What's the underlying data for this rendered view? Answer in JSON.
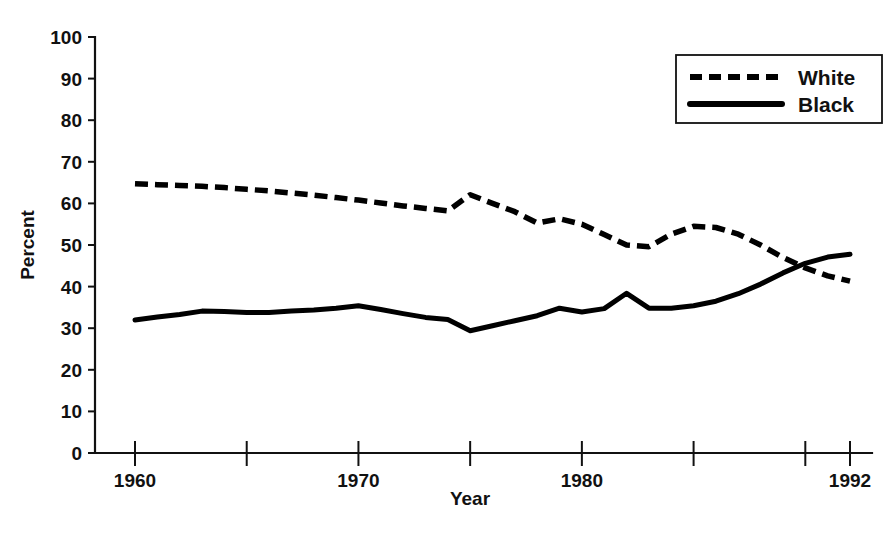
{
  "chart_data": {
    "type": "line",
    "title": "",
    "xlabel": "Year",
    "ylabel": "Percent",
    "xlim": [
      1960,
      1992
    ],
    "ylim": [
      0,
      100
    ],
    "grid": false,
    "legend_position": "top-right",
    "y_ticks": [
      0,
      10,
      20,
      30,
      40,
      50,
      60,
      70,
      80,
      90,
      100
    ],
    "y_tick_labels": [
      "0",
      "10",
      "20",
      "30",
      "40",
      "50",
      "60",
      "70",
      "80",
      "90",
      "100"
    ],
    "x_ticks": [
      1960,
      1965,
      1970,
      1975,
      1980,
      1985,
      1990,
      1992
    ],
    "x_tick_labels": [
      "1960",
      "",
      "1970",
      "",
      "1980",
      "",
      "",
      "1992"
    ],
    "x": [
      1960,
      1961,
      1962,
      1963,
      1964,
      1965,
      1966,
      1967,
      1968,
      1969,
      1970,
      1971,
      1972,
      1973,
      1974,
      1975,
      1976,
      1977,
      1978,
      1979,
      1980,
      1981,
      1982,
      1983,
      1984,
      1985,
      1986,
      1987,
      1988,
      1989,
      1990,
      1991,
      1992
    ],
    "series": [
      {
        "name": "White",
        "style": "dashed",
        "color": "#000000",
        "values": [
          64.7,
          64.5,
          64.3,
          64.1,
          63.8,
          63.4,
          63.0,
          62.5,
          62.0,
          61.4,
          60.8,
          60.1,
          59.4,
          58.8,
          58.2,
          62.1,
          60.0,
          58.0,
          55.3,
          56.3,
          55.0,
          52.5,
          50.0,
          49.6,
          52.6,
          54.5,
          54.2,
          52.6,
          50.0,
          47.0,
          44.5,
          42.6,
          41.3
        ]
      },
      {
        "name": "Black",
        "style": "solid",
        "color": "#000000",
        "values": [
          32.0,
          32.7,
          33.3,
          34.1,
          34.0,
          33.8,
          33.8,
          34.1,
          34.4,
          34.8,
          35.4,
          34.5,
          33.5,
          32.6,
          32.1,
          29.4,
          30.6,
          31.8,
          33.0,
          34.8,
          33.9,
          34.7,
          38.4,
          34.8,
          34.8,
          35.4,
          36.5,
          38.3,
          40.6,
          43.3,
          45.6,
          47.1,
          47.8
        ]
      }
    ],
    "legend": [
      {
        "label": "White",
        "style": "dashed"
      },
      {
        "label": "Black",
        "style": "solid"
      }
    ]
  },
  "axes": {
    "y_title": "Percent",
    "x_title": "Year"
  }
}
